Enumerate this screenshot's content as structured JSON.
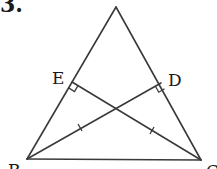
{
  "problem_number": "3.",
  "figure": {
    "type": "triangle",
    "vertices": {
      "A": {
        "label": "A",
        "x": 116,
        "y": 7
      },
      "B": {
        "label": "B",
        "x": 27,
        "y": 159
      },
      "C": {
        "label": "C",
        "x": 201,
        "y": 160
      }
    },
    "points": {
      "E": {
        "label": "E",
        "on": "AB",
        "x": 72,
        "y": 82
      },
      "D": {
        "label": "D",
        "on": "AC",
        "x": 161,
        "y": 83
      }
    },
    "segments": [
      "AB",
      "AC",
      "BC",
      "BD",
      "CE"
    ],
    "right_angles": [
      "E (CE ⟂ AB)",
      "D (BD ⟂ AC)"
    ],
    "equal_marks": [
      "BD",
      "CE"
    ]
  },
  "labels": {
    "A": "A",
    "B": "B",
    "C": "C",
    "D": "D",
    "E": "E"
  },
  "colors": {
    "line": "#3a3a3a",
    "text": "#1a1a1a",
    "background": "#ffffff"
  }
}
